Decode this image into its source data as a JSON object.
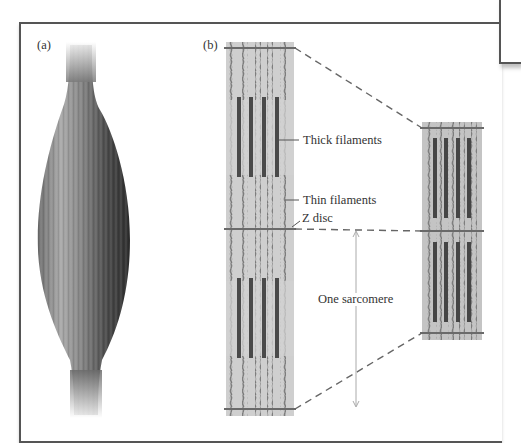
{
  "figure": {
    "panel_a_label": "(a)",
    "panel_b_label": "(b)",
    "panel_a_subject": "muscle",
    "panel_b_subject": "myofibril-sarcomeres"
  },
  "annotations": {
    "thick_filaments": "Thick filaments",
    "thin_filaments": "Thin filaments",
    "z_disc": "Z disc",
    "one_sarcomere": "One sarcomere"
  },
  "colors": {
    "frame": "#555555",
    "strip_background": "#cfcfcf",
    "thick_filament": "#4a4a4a",
    "thin_filament": "#8a8a8a",
    "z_disc": "#6a6a6a",
    "dashed_line": "#666666",
    "muscle_dark": "#3a3a3a",
    "muscle_light": "#b5b5b5"
  }
}
